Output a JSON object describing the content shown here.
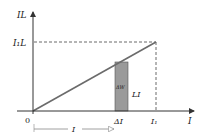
{
  "diagram": {
    "type": "graph",
    "y_axis_label": "IL",
    "x_axis_label": "I",
    "origin_label": "0",
    "y_tick_label": "I₁L",
    "x_tick_labels": [
      "ΔI",
      "I₁"
    ],
    "strip_label": "ΔW",
    "strip_height_label": "LI",
    "bottom_arrow_label": "I",
    "colors": {
      "axis": "#333333",
      "line": "#6b6b6b",
      "strip_fill": "#9a9a9a",
      "dashed": "#444444"
    }
  }
}
